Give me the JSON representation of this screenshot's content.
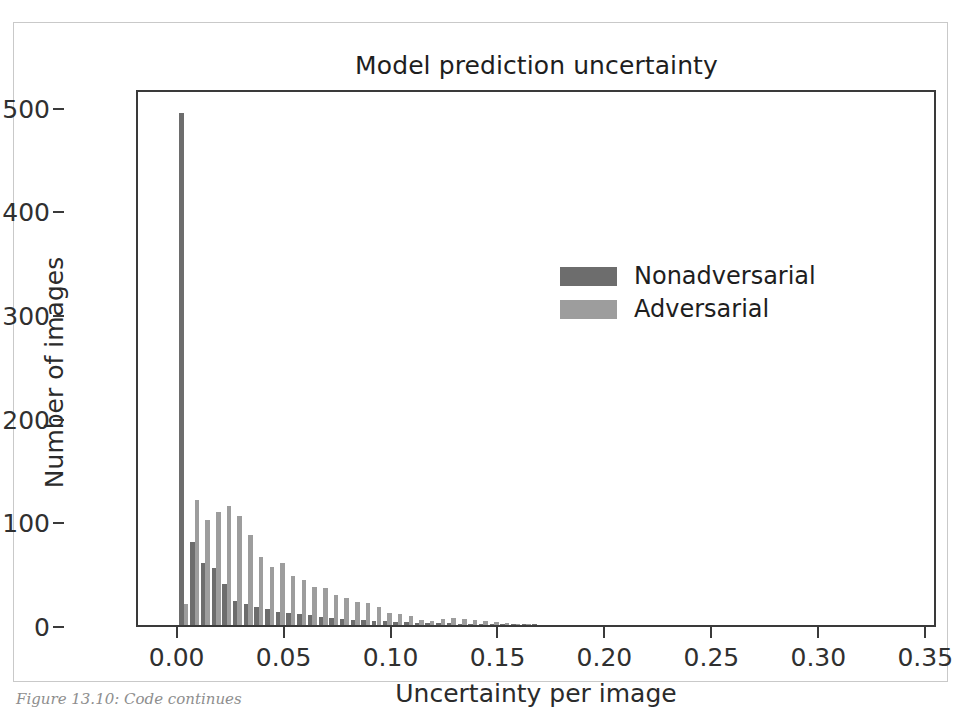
{
  "figure": {
    "title": "Model prediction uncertainty",
    "caption": "Figure 13.10: Code continues",
    "top_bleed_text": ""
  },
  "legend": {
    "position": "center-right",
    "entries": [
      {
        "label": "Nonadversarial",
        "color": "#6d6d6d"
      },
      {
        "label": "Adversarial",
        "color": "#9d9d9d"
      }
    ]
  },
  "chart_data": {
    "type": "bar",
    "title": "Model prediction uncertainty",
    "xlabel": "Uncertainty per image",
    "ylabel": "Number of images",
    "xlim": [
      -0.019,
      0.355
    ],
    "ylim": [
      0,
      518
    ],
    "grid": false,
    "legend_position": "center right",
    "xticks": [
      "0.00",
      "0.05",
      "0.10",
      "0.15",
      "0.20",
      "0.25",
      "0.30",
      "0.35"
    ],
    "xtick_values": [
      0.0,
      0.05,
      0.1,
      0.15,
      0.2,
      0.25,
      0.3,
      0.35
    ],
    "yticks": [
      "0",
      "100",
      "200",
      "300",
      "400",
      "500"
    ],
    "ytick_values": [
      0,
      100,
      200,
      300,
      400,
      500
    ],
    "bin_centers": [
      0.0025,
      0.0075,
      0.0125,
      0.0175,
      0.0225,
      0.0275,
      0.0325,
      0.0375,
      0.0425,
      0.0475,
      0.0525,
      0.0575,
      0.0625,
      0.0675,
      0.0725,
      0.0775,
      0.0825,
      0.0875,
      0.0925,
      0.0975,
      0.1025,
      0.1075,
      0.1125,
      0.1175,
      0.1225,
      0.1275,
      0.1325,
      0.1375,
      0.1425,
      0.1475,
      0.1525,
      0.1575,
      0.1625,
      0.1675,
      0.1725,
      0.1775,
      0.1825,
      0.1875,
      0.1925,
      0.1975,
      0.2025,
      0.2075,
      0.2125,
      0.2175
    ],
    "bin_width": 0.005,
    "series": [
      {
        "name": "Nonadversarial",
        "color": "#6d6d6d",
        "values": [
          494,
          80,
          60,
          55,
          40,
          23,
          20,
          17,
          15,
          13,
          12,
          11,
          10,
          8,
          7,
          6,
          5,
          5,
          4,
          4,
          3,
          3,
          2,
          2,
          2,
          2,
          1,
          1,
          1,
          1,
          1,
          1,
          1,
          1,
          0,
          0,
          0,
          0,
          0,
          0,
          0,
          0,
          0,
          0
        ]
      },
      {
        "name": "Adversarial",
        "color": "#9d9d9d",
        "values": [
          20,
          121,
          101,
          109,
          115,
          105,
          87,
          66,
          56,
          60,
          47,
          43,
          37,
          36,
          29,
          26,
          22,
          21,
          17,
          12,
          11,
          9,
          5,
          4,
          6,
          7,
          6,
          5,
          4,
          3,
          2,
          1,
          1,
          0,
          0,
          0,
          0,
          0,
          0,
          0,
          0,
          0,
          0,
          0
        ]
      }
    ]
  }
}
